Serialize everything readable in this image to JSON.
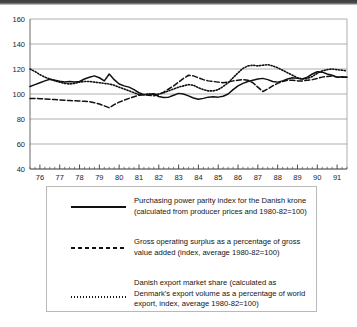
{
  "chart_data": {
    "type": "line",
    "title": "",
    "xlabel": "",
    "ylabel": "",
    "ylim": [
      40,
      160
    ],
    "ytick_values": [
      40,
      60,
      80,
      100,
      120,
      140,
      160
    ],
    "ytick_labels": [
      "40",
      "60",
      "80",
      "100",
      "120",
      "140",
      "160"
    ],
    "grid": true,
    "legend_position": "below-plot",
    "x": [
      1975.5,
      1975.75,
      1976.0,
      1976.25,
      1976.5,
      1976.75,
      1977.0,
      1977.25,
      1977.5,
      1977.75,
      1978.0,
      1978.25,
      1978.5,
      1978.75,
      1979.0,
      1979.25,
      1979.5,
      1979.75,
      1980.0,
      1980.25,
      1980.5,
      1980.75,
      1981.0,
      1981.25,
      1981.5,
      1981.75,
      1982.0,
      1982.25,
      1982.5,
      1982.75,
      1983.0,
      1983.25,
      1983.5,
      1983.75,
      1984.0,
      1984.25,
      1984.5,
      1984.75,
      1985.0,
      1985.25,
      1985.5,
      1985.75,
      1986.0,
      1986.25,
      1986.5,
      1986.75,
      1987.0,
      1987.25,
      1987.5,
      1987.75,
      1988.0,
      1988.25,
      1988.5,
      1988.75,
      1989.0,
      1989.25,
      1989.5,
      1989.75,
      1990.0,
      1990.25,
      1990.5,
      1990.75,
      1991.0,
      1991.25,
      1991.5
    ],
    "xtick_labels": [
      "76",
      "77",
      "78",
      "79",
      "80",
      "81",
      "82",
      "83",
      "84",
      "85",
      "86",
      "87",
      "88",
      "89",
      "90",
      "91"
    ],
    "xtick_values": [
      1976,
      1977,
      1978,
      1979,
      1980,
      1981,
      1982,
      1983,
      1984,
      1985,
      1986,
      1987,
      1988,
      1989,
      1990,
      1991
    ],
    "minor_ticks_per_year": 4,
    "series": [
      {
        "name": "Purchasing power parity index for the Danish krone",
        "style": "solid",
        "color": "#111111",
        "values": [
          106.0,
          107.5,
          109.0,
          110.5,
          111.8,
          111.0,
          110.2,
          109.6,
          110.0,
          109.6,
          110.0,
          112.0,
          113.4,
          114.5,
          113.0,
          110.5,
          116.0,
          111.5,
          108.0,
          106.5,
          105.5,
          103.5,
          101.0,
          99.5,
          99.8,
          100.2,
          98.0,
          97.2,
          97.5,
          99.0,
          100.5,
          100.0,
          98.5,
          96.8,
          95.8,
          96.5,
          97.5,
          97.8,
          97.5,
          98.2,
          100.0,
          103.5,
          106.5,
          108.5,
          110.0,
          111.0,
          112.0,
          112.5,
          111.5,
          110.0,
          109.5,
          110.5,
          112.0,
          113.0,
          112.5,
          112.0,
          113.5,
          116.0,
          117.8,
          117.5,
          116.0,
          115.0,
          113.5,
          113.8,
          113.5
        ]
      },
      {
        "name": "Gross operating surplus as a percentage of gross value added",
        "style": "dashed",
        "color": "#111111",
        "values": [
          96.5,
          96.5,
          96.3,
          96.0,
          95.8,
          95.6,
          95.3,
          95.0,
          94.8,
          94.6,
          94.4,
          94.2,
          93.8,
          93.0,
          92.0,
          90.5,
          89.0,
          91.5,
          93.5,
          95.0,
          96.5,
          97.8,
          99.0,
          99.5,
          99.0,
          98.5,
          99.5,
          101.5,
          104.0,
          106.5,
          109.5,
          112.5,
          115.0,
          114.5,
          113.0,
          111.5,
          110.5,
          110.0,
          109.5,
          109.0,
          109.5,
          110.5,
          111.0,
          111.5,
          111.0,
          109.0,
          105.5,
          102.0,
          104.0,
          106.5,
          108.5,
          110.0,
          111.0,
          111.0,
          110.5,
          110.5,
          111.0,
          111.5,
          112.5,
          113.5,
          114.0,
          114.5,
          113.5,
          113.5,
          113.5
        ]
      },
      {
        "name": "Danish export market share",
        "style": "dotted",
        "color": "#111111",
        "values": [
          120.0,
          118.0,
          115.5,
          113.5,
          112.0,
          110.5,
          109.5,
          108.5,
          108.0,
          108.5,
          109.5,
          110.0,
          110.0,
          109.5,
          109.0,
          108.5,
          108.0,
          107.0,
          105.5,
          104.0,
          102.5,
          101.0,
          99.5,
          99.5,
          100.0,
          99.5,
          100.0,
          101.0,
          102.5,
          104.0,
          105.5,
          106.5,
          107.5,
          107.0,
          105.0,
          103.5,
          102.5,
          102.5,
          103.5,
          106.0,
          109.0,
          113.0,
          117.0,
          120.5,
          122.5,
          123.0,
          122.5,
          123.0,
          123.5,
          122.5,
          121.0,
          119.0,
          117.0,
          115.0,
          113.0,
          112.0,
          112.5,
          114.0,
          116.5,
          118.5,
          119.5,
          120.0,
          119.5,
          119.0,
          118.5
        ]
      }
    ]
  },
  "legend": {
    "entries": [
      {
        "sample": "solid-line-sample",
        "text": "Purchasing power parity index for the Danish krone (calculated from producer prices and 1980-82=100)"
      },
      {
        "sample": "dashed-line-sample",
        "text": "Gross operating surplus as a percentage of gross value added (index, average 1980-82=100)"
      },
      {
        "sample": "dotted-line-sample",
        "text": "Danish export market share (calculated as Denmark's export volume as a percentage of world export, index, average 1980-82=100)"
      }
    ]
  }
}
